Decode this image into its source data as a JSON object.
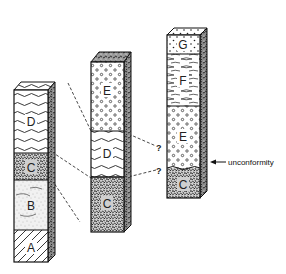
{
  "diagram": {
    "type": "stratigraphic-columns",
    "columns": [
      {
        "id": "column-1",
        "layers_top_to_bottom": [
          {
            "label": "D",
            "pattern": "wavy-lines"
          },
          {
            "label": "C",
            "pattern": "dense-speckle"
          },
          {
            "label": "B",
            "pattern": "light-speckle-with-lines"
          },
          {
            "label": "A",
            "pattern": "diagonal-hatch"
          }
        ]
      },
      {
        "id": "column-2",
        "layers_top_to_bottom": [
          {
            "label": "E",
            "pattern": "circles"
          },
          {
            "label": "D",
            "pattern": "wavy-lines"
          },
          {
            "label": "C",
            "pattern": "dense-speckle"
          }
        ]
      },
      {
        "id": "column-3",
        "layers_top_to_bottom": [
          {
            "label": "G",
            "pattern": "dots"
          },
          {
            "label": "F",
            "pattern": "lenses"
          },
          {
            "label": "E",
            "pattern": "circles"
          },
          {
            "label": "C",
            "pattern": "dense-speckle"
          }
        ]
      }
    ],
    "correlation_marks": [
      "?",
      "?"
    ],
    "annotation": {
      "label": "unconformity",
      "arrow": "left-arrow"
    }
  }
}
